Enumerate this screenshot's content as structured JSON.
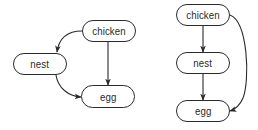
{
  "diagrams": [
    {
      "id": "left",
      "layout": "triangle",
      "nodes": [
        {
          "key": "chicken",
          "label": "chicken",
          "x": 82,
          "y": 20,
          "w": 54,
          "h": 22
        },
        {
          "key": "nest",
          "label": "nest",
          "x": 13,
          "y": 53,
          "w": 54,
          "h": 22
        },
        {
          "key": "egg",
          "label": "egg",
          "x": 81,
          "y": 85,
          "w": 54,
          "h": 23
        }
      ],
      "edges": [
        {
          "from": "chicken",
          "to": "nest",
          "shape": "curved"
        },
        {
          "from": "chicken",
          "to": "egg",
          "shape": "straight"
        },
        {
          "from": "nest",
          "to": "egg",
          "shape": "curved"
        }
      ]
    },
    {
      "id": "right",
      "layout": "vertical-chain",
      "nodes": [
        {
          "key": "chicken",
          "label": "chicken",
          "x": 176,
          "y": 4,
          "w": 54,
          "h": 22
        },
        {
          "key": "nest",
          "label": "nest",
          "x": 176,
          "y": 52,
          "w": 54,
          "h": 22
        },
        {
          "key": "egg",
          "label": "egg",
          "x": 176,
          "y": 100,
          "w": 54,
          "h": 22
        }
      ],
      "edges": [
        {
          "from": "chicken",
          "to": "nest",
          "shape": "straight"
        },
        {
          "from": "nest",
          "to": "egg",
          "shape": "straight"
        },
        {
          "from": "chicken",
          "to": "egg",
          "shape": "curved-bypass"
        }
      ]
    }
  ],
  "colors": {
    "stroke": "#2a2a2a",
    "background": "#ffffff",
    "text": "#2a2a2a"
  }
}
